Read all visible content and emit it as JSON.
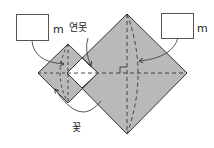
{
  "figure": {
    "labels": {
      "left_unit": "m",
      "right_unit": "m",
      "pond": "연못",
      "flower": "꽃"
    },
    "answer_boxes": [
      {
        "id": "left",
        "value": ""
      },
      {
        "id": "right",
        "value": ""
      }
    ],
    "colors": {
      "fill": "#b9b9b9",
      "stroke": "#333333",
      "pond_fill": "#ffffff"
    },
    "shapes": {
      "large_square": "square rotated 45°, shaded",
      "small_square": "square rotated 45°, shaded",
      "overlap": "small white square (pond) where the two squares overlap"
    }
  }
}
